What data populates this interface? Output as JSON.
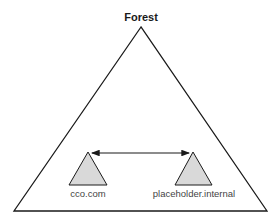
{
  "diagram": {
    "title": "Forest",
    "domains": [
      {
        "label": "cco.com"
      },
      {
        "label": "placeholder.internal"
      }
    ],
    "relationship": "two-way trust",
    "colors": {
      "outline": "#1a1a1a",
      "domain_fill": "#d9d9d9",
      "label": "#444444"
    }
  }
}
